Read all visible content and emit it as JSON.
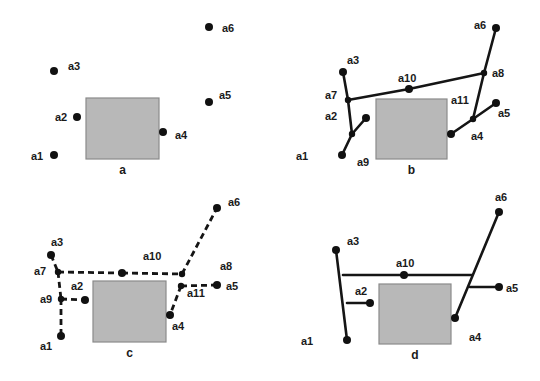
{
  "colors": {
    "obstacle_fill": "#b8b8b8",
    "obstacle_stroke": "#8a8a8a",
    "node": "#111111",
    "wire": "#151515"
  },
  "panels": [
    {
      "id": "a",
      "caption": "a",
      "obstacle": {
        "x": 86,
        "y": 98,
        "w": 73,
        "h": 61
      },
      "nodes": [
        {
          "name": "a1",
          "x": 54,
          "y": 155,
          "label": "a1",
          "lx": 31,
          "ly": 160
        },
        {
          "name": "a2",
          "x": 77,
          "y": 117,
          "label": "a2",
          "lx": 55,
          "ly": 121
        },
        {
          "name": "a3",
          "x": 54,
          "y": 71,
          "label": "a3",
          "lx": 68,
          "ly": 70
        },
        {
          "name": "a4",
          "x": 163,
          "y": 132,
          "label": "a4",
          "lx": 175,
          "ly": 139
        },
        {
          "name": "a5",
          "x": 209,
          "y": 102,
          "label": "a5",
          "lx": 219,
          "ly": 99
        },
        {
          "name": "a6",
          "x": 209,
          "y": 27,
          "label": "a6",
          "lx": 222,
          "ly": 32
        }
      ]
    },
    {
      "id": "b",
      "caption": "b",
      "obstacle": {
        "x": 376,
        "y": 99,
        "w": 71,
        "h": 60
      },
      "nodes": [
        {
          "name": "a1",
          "x": 342,
          "y": 155,
          "label": "a1",
          "lx": 296,
          "ly": 160
        },
        {
          "name": "a2",
          "x": 366,
          "y": 118,
          "label": "a2",
          "lx": 325,
          "ly": 120
        },
        {
          "name": "a3",
          "x": 343,
          "y": 72,
          "label": "a3",
          "lx": 347,
          "ly": 64
        },
        {
          "name": "a4",
          "x": 451,
          "y": 134,
          "label": "a4",
          "lx": 471,
          "ly": 140
        },
        {
          "name": "a5",
          "x": 496,
          "y": 103,
          "label": "a5",
          "lx": 498,
          "ly": 117
        },
        {
          "name": "a6",
          "x": 496,
          "y": 28,
          "label": "a6",
          "lx": 474,
          "ly": 29
        },
        {
          "name": "a7",
          "x": 348,
          "y": 100,
          "label": "a7",
          "lx": 325,
          "ly": 99
        },
        {
          "name": "a8",
          "x": 484,
          "y": 73,
          "label": "a8",
          "lx": 492,
          "ly": 77
        },
        {
          "name": "a9",
          "x": 352,
          "y": 134,
          "label": "a9",
          "lx": 357,
          "ly": 166
        },
        {
          "name": "a10",
          "x": 409,
          "y": 89,
          "label": "a10",
          "lx": 398,
          "ly": 82
        },
        {
          "name": "a11",
          "x": 473,
          "y": 119,
          "label": "a11",
          "lx": 451,
          "ly": 104
        }
      ],
      "edges": [
        [
          "a3",
          "a7"
        ],
        [
          "a7",
          "a9"
        ],
        [
          "a9",
          "a1"
        ],
        [
          "a9",
          "a2"
        ],
        [
          "a7",
          "a10"
        ],
        [
          "a10",
          "a8"
        ],
        [
          "a6",
          "a8"
        ],
        [
          "a8",
          "a11"
        ],
        [
          "a11",
          "a4"
        ],
        [
          "a11",
          "a5"
        ]
      ]
    },
    {
      "id": "c",
      "caption": "c",
      "obstacle": {
        "x": 93,
        "y": 281,
        "w": 73,
        "h": 61
      },
      "nodes": [
        {
          "name": "a1",
          "x": 61,
          "y": 336,
          "label": "a1",
          "lx": 40,
          "ly": 350
        },
        {
          "name": "a2",
          "x": 85,
          "y": 300,
          "label": "a2",
          "lx": 71,
          "ly": 290
        },
        {
          "name": "a3",
          "x": 51,
          "y": 255,
          "label": "a3",
          "lx": 51,
          "ly": 246
        },
        {
          "name": "a4",
          "x": 170,
          "y": 315,
          "label": "a4",
          "lx": 172,
          "ly": 330
        },
        {
          "name": "a5",
          "x": 217,
          "y": 285,
          "label": "a5",
          "lx": 226,
          "ly": 290
        },
        {
          "name": "a6",
          "x": 217,
          "y": 208,
          "label": "a6",
          "lx": 228,
          "ly": 206
        },
        {
          "name": "a7",
          "x": 58,
          "y": 272,
          "label": "a7",
          "lx": 34,
          "ly": 275
        },
        {
          "name": "a8",
          "x": 182,
          "y": 274,
          "label": "a8",
          "lx": 220,
          "ly": 270
        },
        {
          "name": "a9",
          "x": 61,
          "y": 299,
          "label": "a9",
          "lx": 40,
          "ly": 303
        },
        {
          "name": "a10",
          "x": 122,
          "y": 273,
          "label": "a10",
          "lx": 143,
          "ly": 260
        },
        {
          "name": "a11",
          "x": 181,
          "y": 286,
          "label": "a11",
          "lx": 187,
          "ly": 297
        }
      ],
      "edges": [
        [
          "a3",
          "a7"
        ],
        [
          "a7",
          "a9"
        ],
        [
          "a9",
          "a1"
        ],
        [
          "a9",
          "a2"
        ],
        [
          "a7",
          "a10"
        ],
        [
          "a10",
          "a8"
        ],
        [
          "a8",
          "a6"
        ],
        [
          "a11",
          "a5"
        ],
        [
          "a11",
          "a4"
        ]
      ]
    },
    {
      "id": "d",
      "caption": "d",
      "obstacle": {
        "x": 379,
        "y": 284,
        "w": 72,
        "h": 60
      },
      "nodes": [
        {
          "name": "a1",
          "x": 347,
          "y": 340,
          "label": "a1",
          "lx": 301,
          "ly": 345
        },
        {
          "name": "a2",
          "x": 370,
          "y": 303,
          "label": "a2",
          "lx": 355,
          "ly": 295
        },
        {
          "name": "a3",
          "x": 336,
          "y": 250,
          "label": "a3",
          "lx": 347,
          "ly": 245
        },
        {
          "name": "a4",
          "x": 455,
          "y": 318,
          "label": "a4",
          "lx": 469,
          "ly": 341
        },
        {
          "name": "a5",
          "x": 499,
          "y": 287,
          "label": "a5",
          "lx": 506,
          "ly": 292
        },
        {
          "name": "a6",
          "x": 499,
          "y": 212,
          "label": "a6",
          "lx": 495,
          "ly": 201
        },
        {
          "name": "a10",
          "x": 404,
          "y": 275,
          "label": "a10",
          "lx": 396,
          "ly": 267
        }
      ],
      "junctions": {
        "left_top": [
          343,
          275
        ],
        "left_mid": [
          347,
          303
        ],
        "right_top": [
          472,
          275
        ],
        "right_mid": [
          470,
          287
        ]
      },
      "edges": [
        [
          "a3",
          "a1"
        ],
        [
          "left_top",
          "right_top"
        ],
        [
          "left_mid",
          "a2"
        ],
        [
          "a6",
          "a4"
        ],
        [
          "right_mid",
          "a5"
        ]
      ]
    }
  ]
}
